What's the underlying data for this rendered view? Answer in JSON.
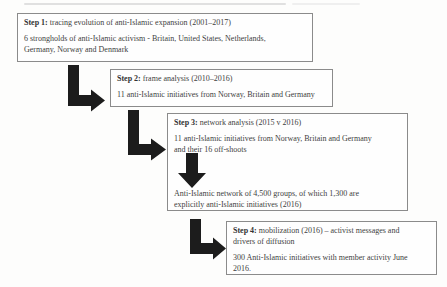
{
  "colors": {
    "page_bg": "#fdfdfc",
    "box_border": "#8b8b8b",
    "text": "#3e3e3e",
    "arrow": "#1c1c1c"
  },
  "icons": {
    "elbow_arrow": "solid L-shaped connector arrow pointing down then right",
    "down_arrow": "solid block arrow pointing down"
  },
  "steps": [
    {
      "label": "Step 1:",
      "title": " tracing evolution of anti-Islamic expansion (2001–2017)",
      "body": [
        "6 strongholds of anti-Islamic activism - Britain, United States, Netherlands,",
        "Germany, Norway and Denmark"
      ]
    },
    {
      "label": "Step 2:",
      "title": " frame analysis (2010–2016)",
      "body": [
        "11 anti-Islamic initiatives from Norway, Britain and Germany"
      ]
    },
    {
      "label": "Step 3:",
      "title": " network analysis (2015 v 2016)",
      "body": [
        "11 anti-Islamic initiatives from Norway, Britain and Germany",
        "and their 16 off-shoots"
      ],
      "result": [
        "Anti-Islamic network of 4,500 groups, of which 1,300 are",
        "explicitly anti-Islamic initiatives (2016)"
      ]
    },
    {
      "label": "Step 4:",
      "title": " mobilization (2016) – activist messages and",
      "title_line2": "drivers of diffusion",
      "body": [
        "300 Anti-Islamic initiatives with member activity June",
        "2016."
      ]
    }
  ]
}
